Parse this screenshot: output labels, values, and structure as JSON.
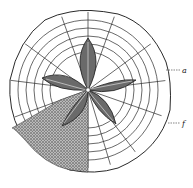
{
  "figure": {
    "labels": [
      {
        "id": "a",
        "text": "a",
        "x": 182,
        "y": 67
      },
      {
        "id": "f",
        "text": "f",
        "x": 182,
        "y": 120
      }
    ],
    "colors": {
      "ink": "#2a2a2a",
      "paper": "#ffffff",
      "stipple": "#555555"
    }
  }
}
